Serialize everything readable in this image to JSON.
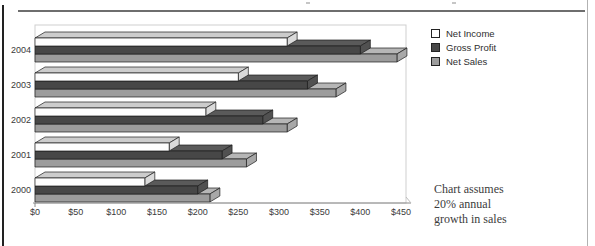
{
  "page": {
    "background": "#ffffff",
    "top_rule_color": "#6e6e6e",
    "left_border_color": "#222222",
    "right_border_color": "#b2b2b2",
    "text_color": "#3a3a3a"
  },
  "chart_data": {
    "type": "bar",
    "orientation": "horizontal",
    "projection": "3d",
    "title": "",
    "xlabel": "",
    "ylabel": "",
    "grid": false,
    "legend_position": "top-right-outside",
    "categories": [
      "2000",
      "2001",
      "2002",
      "2003",
      "2004"
    ],
    "series": [
      {
        "name": "Net Income",
        "values": [
          135,
          165,
          210,
          250,
          310
        ],
        "front_color": "#fdfdfd",
        "top_color": "#cccccc",
        "side_color": "#dadada"
      },
      {
        "name": "Gross Profit",
        "values": [
          200,
          230,
          280,
          335,
          400
        ],
        "front_color": "#474747",
        "top_color": "#5a5a5a",
        "side_color": "#515151"
      },
      {
        "name": "Net Sales",
        "values": [
          215,
          260,
          310,
          370,
          445
        ],
        "front_color": "#9c9c9c",
        "top_color": "#b6b6b6",
        "side_color": "#a8a8a8"
      }
    ],
    "x_ticks": [
      "$0",
      "$50",
      "$100",
      "$150",
      "$200",
      "$250",
      "$300",
      "$350",
      "$400",
      "$450"
    ],
    "x_range": [
      0,
      450
    ],
    "outline_color": "#1c1c1c",
    "frame_color": "#cfcfcf",
    "axis_line_color": "#8a8a8a",
    "annotation": "Chart assumes 20% annual growth in sales"
  },
  "note": {
    "lines": [
      "Chart assumes",
      "20% annual",
      "growth in sales"
    ]
  }
}
